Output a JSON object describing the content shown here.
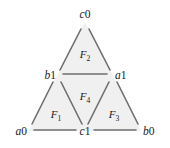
{
  "figure": {
    "type": "simplicial-complex-diagram",
    "background_color": "#ffffff",
    "fill_color": "#f0f0f0",
    "edge_color": "#6e6e6e",
    "text_color": "#1a1a1a",
    "edge_width": 1.6
  },
  "vertices": [
    {
      "id": "c0",
      "letter": "c",
      "index": "0",
      "label": "c0",
      "role": "top-apex",
      "x": 85,
      "y": 22,
      "label_x": 85,
      "label_y": 15
    },
    {
      "id": "b1",
      "letter": "b",
      "index": "1",
      "label": "b1",
      "role": "mid-left",
      "x": 57,
      "y": 76,
      "label_x": 48,
      "label_y": 74
    },
    {
      "id": "a1",
      "letter": "a",
      "index": "1",
      "label": "a1",
      "role": "mid-right",
      "x": 113,
      "y": 76,
      "label_x": 123,
      "label_y": 74
    },
    {
      "id": "a0",
      "letter": "a",
      "index": "0",
      "label": "a0",
      "role": "bottom-left",
      "x": 29,
      "y": 131,
      "label_x": 19,
      "label_y": 135
    },
    {
      "id": "c1",
      "letter": "c",
      "index": "1",
      "label": "c1",
      "role": "bottom-mid",
      "x": 85,
      "y": 131,
      "label_x": 85,
      "label_y": 139
    },
    {
      "id": "b0",
      "letter": "b",
      "index": "0",
      "label": "b0",
      "role": "bottom-right",
      "x": 141,
      "y": 131,
      "label_x": 151,
      "label_y": 135
    }
  ],
  "faces": [
    {
      "id": "F1",
      "letter": "F",
      "index": "1",
      "label": "F1",
      "position": "bottom-left",
      "vertices": [
        "a0",
        "b1",
        "c1"
      ],
      "label_x": 57,
      "label_y": 114
    },
    {
      "id": "F2",
      "letter": "F",
      "index": "2",
      "label": "F2",
      "position": "top",
      "vertices": [
        "c0",
        "b1",
        "a1"
      ],
      "label_x": 85,
      "label_y": 54
    },
    {
      "id": "F3",
      "letter": "F",
      "index": "3",
      "label": "F3",
      "position": "bottom-right",
      "vertices": [
        "c1",
        "a1",
        "b0"
      ],
      "label_x": 113,
      "label_y": 114
    },
    {
      "id": "F4",
      "letter": "F",
      "index": "4",
      "label": "F4",
      "position": "center-inverted",
      "vertices": [
        "b1",
        "a1",
        "c1"
      ],
      "label_x": 85,
      "label_y": 96
    }
  ],
  "edges": [
    {
      "id": "c0-b1",
      "from": "c0",
      "to": "b1"
    },
    {
      "id": "c0-a1",
      "from": "c0",
      "to": "a1"
    },
    {
      "id": "b1-a1",
      "from": "b1",
      "to": "a1"
    },
    {
      "id": "b1-a0",
      "from": "b1",
      "to": "a0"
    },
    {
      "id": "b1-c1",
      "from": "b1",
      "to": "c1"
    },
    {
      "id": "a1-c1",
      "from": "a1",
      "to": "c1"
    },
    {
      "id": "a1-b0",
      "from": "a1",
      "to": "b0"
    },
    {
      "id": "a0-c1",
      "from": "a0",
      "to": "c1"
    },
    {
      "id": "c1-b0",
      "from": "c1",
      "to": "b0"
    }
  ]
}
